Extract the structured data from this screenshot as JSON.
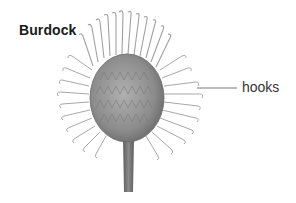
{
  "diagram": {
    "title": "Burdock",
    "labels": [
      {
        "text": "hooks",
        "target": "hooked bracts of burr"
      }
    ],
    "colors": {
      "background": "#ffffff",
      "head": "#8a8a8a",
      "hooks": "#a8a8a8",
      "stem": "#6e6e6e",
      "leader_line": "#555555",
      "text": "#1a1a1a"
    },
    "icons": [
      "burdock-burr-illustration"
    ]
  }
}
